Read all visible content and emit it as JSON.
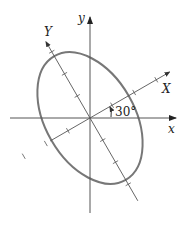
{
  "diagram": {
    "title": "",
    "axes": {
      "x_label": "x",
      "y_label": "y",
      "rotated_x_label": "X",
      "rotated_y_label": "Y"
    },
    "rotation_angle_label": "30°",
    "rotation_angle_deg": 30,
    "ellipse": {
      "semi_axis_along_X_ticks": 1.75,
      "semi_axis_along_Y_ticks": 2.8,
      "color": "#777777"
    },
    "ticks_per_side": {
      "X": 3,
      "Y": 3
    },
    "axis_color": "#555555"
  }
}
